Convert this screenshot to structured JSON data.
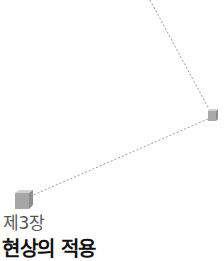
{
  "chapter": {
    "label": "제3장",
    "title": "현상의 적용"
  },
  "graphics": {
    "line_color": "#9a9a9a",
    "cube_color": "#a8a8a8",
    "cube_top": "#cfcfcf",
    "cube_side": "#8e8e8e",
    "icons": [
      "cube-icon",
      "cube-icon"
    ]
  }
}
